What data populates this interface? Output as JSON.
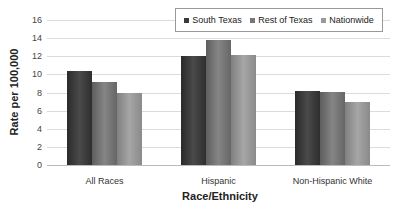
{
  "chart_data": {
    "type": "bar",
    "title": "",
    "xlabel": "Race/Ethnicity",
    "ylabel": "Rate per 100,000",
    "ylim": [
      0,
      16
    ],
    "yticks": [
      0,
      2,
      4,
      6,
      8,
      10,
      12,
      14,
      16
    ],
    "grid": true,
    "legend_position": "top-right",
    "categories": [
      "All Races",
      "Hispanic",
      "Non-Hispanic White"
    ],
    "series": [
      {
        "name": "South Texas",
        "color": "#3a3a3a",
        "values": [
          10.4,
          12.0,
          8.2
        ]
      },
      {
        "name": "Rest of Texas",
        "color": "#777777",
        "values": [
          9.2,
          13.8,
          8.1
        ]
      },
      {
        "name": "Nationwide",
        "color": "#999999",
        "values": [
          8.0,
          12.1,
          7.0
        ]
      }
    ]
  }
}
